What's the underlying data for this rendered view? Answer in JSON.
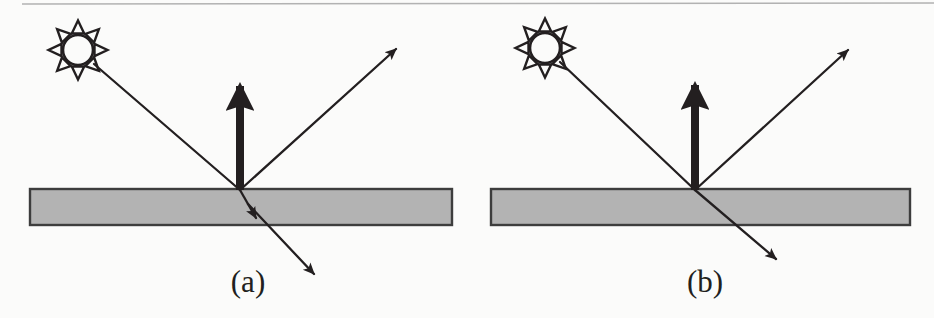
{
  "figure": {
    "background_color": "#fbfbfa",
    "ink_color": "#231f20",
    "slab_fill_color": "#b3b3b3",
    "slab_border_color": "#3d3d3d",
    "scan_line_color": "#9a9a9a"
  },
  "panels": [
    {
      "id": "a",
      "caption": "(a)",
      "caption_x": 248,
      "caption_y": 292,
      "sun": {
        "label": "sun-icon",
        "cx": 78,
        "cy": 50,
        "core_radius": 15,
        "ray_count": 8,
        "ray_length": 13
      },
      "slab": {
        "label": "material-slab",
        "x": 30,
        "y": 189,
        "width": 422,
        "height": 36
      },
      "incident_ray": {
        "label": "incident-ray",
        "x1": 94,
        "y1": 64,
        "x2": 240,
        "y2": 190,
        "arrow": false,
        "weight": "thin"
      },
      "normal_arrow": {
        "label": "surface-normal-arrow",
        "x1": 240,
        "y1": 190,
        "x2": 240,
        "y2": 86,
        "arrow": true,
        "weight": "thick"
      },
      "reflected_ray": {
        "label": "reflected-ray",
        "x1": 240,
        "y1": 190,
        "x2": 396,
        "y2": 49,
        "arrow": true,
        "weight": "thin"
      },
      "refracted_ray_inside": {
        "label": "refracted-ray-inside-slab",
        "x1": 240,
        "y1": 190,
        "x2": 256,
        "y2": 218,
        "arrow": true,
        "weight": "thin"
      },
      "refracted_ray_exit": {
        "label": "refracted-ray-exit",
        "x1": 248,
        "y1": 204,
        "x2": 314,
        "y2": 274,
        "arrow": true,
        "weight": "thin"
      }
    },
    {
      "id": "b",
      "caption": "(b)",
      "caption_x": 705,
      "caption_y": 292,
      "sun": {
        "label": "sun-icon",
        "cx": 545,
        "cy": 48,
        "core_radius": 15,
        "ray_count": 8,
        "ray_length": 13
      },
      "slab": {
        "label": "material-slab",
        "x": 491,
        "y": 189,
        "width": 419,
        "height": 36
      },
      "incident_ray": {
        "label": "incident-ray",
        "x1": 560,
        "y1": 62,
        "x2": 695,
        "y2": 190,
        "arrow": false,
        "weight": "thin"
      },
      "normal_arrow": {
        "label": "surface-normal-arrow",
        "x1": 695,
        "y1": 190,
        "x2": 695,
        "y2": 85,
        "arrow": true,
        "weight": "thick"
      },
      "reflected_ray": {
        "label": "reflected-ray",
        "x1": 695,
        "y1": 190,
        "x2": 848,
        "y2": 50,
        "arrow": true,
        "weight": "thin"
      },
      "refracted_ray_inside": {
        "label": "refracted-ray-through-slab",
        "x1": 695,
        "y1": 190,
        "x2": 776,
        "y2": 259,
        "arrow": true,
        "weight": "thin"
      }
    }
  ],
  "scan_line": {
    "label": "scanner-artifact-line",
    "x1": 22,
    "y1": 4,
    "x2": 934,
    "y2": 3
  }
}
